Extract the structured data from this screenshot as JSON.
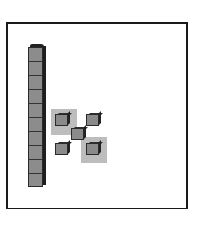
{
  "diagram": {
    "frame": {
      "border_color": "#1a1a1a",
      "background": "#ffffff"
    },
    "ten_rod": {
      "units": 10,
      "color": "#8c8c8c"
    },
    "unit_cubes": [
      {
        "id": "top-left",
        "highlighted": true
      },
      {
        "id": "top-right",
        "highlighted": false
      },
      {
        "id": "center",
        "highlighted": false
      },
      {
        "id": "bottom-left",
        "highlighted": false
      },
      {
        "id": "bottom-right",
        "highlighted": true
      }
    ],
    "highlight_color": "#bdbdbd",
    "cube_color": "#8a8a8a"
  }
}
